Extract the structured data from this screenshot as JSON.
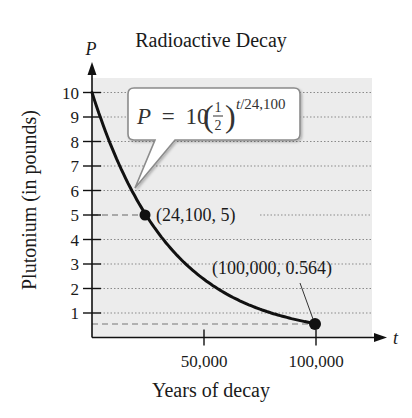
{
  "page": {
    "top_cut_text": "...after 100,000 years."
  },
  "chart_data": {
    "type": "line",
    "title": "Radioactive Decay",
    "xlabel": "Years of decay",
    "ylabel": "Plutonium (in pounds)",
    "x_axis_var": "t",
    "y_axis_var": "P",
    "xlim": [
      0,
      120000
    ],
    "ylim": [
      0,
      10.5
    ],
    "x_ticks": [
      50000,
      100000
    ],
    "x_tick_labels": [
      "50,000",
      "100,000"
    ],
    "y_ticks": [
      1,
      2,
      3,
      4,
      5,
      6,
      7,
      8,
      9,
      10
    ],
    "y_tick_labels": [
      "1",
      "2",
      "3",
      "4",
      "5",
      "6",
      "7",
      "8",
      "9",
      "10"
    ],
    "grid": "horizontal dotted",
    "equation": "P = 10(1/2)^(t/24,100)",
    "equation_parts": {
      "lhs": "P",
      "eq": "=",
      "coef": "10",
      "num": "1",
      "den": "2",
      "exp": "t/24,100"
    },
    "series": [
      {
        "name": "P = 10(1/2)^(t/24,100)",
        "x": [
          0,
          10000,
          20000,
          24100,
          30000,
          40000,
          50000,
          60000,
          70000,
          80000,
          90000,
          100000
        ],
        "values": [
          10,
          7.5,
          5.63,
          5,
          4.22,
          3.16,
          2.38,
          1.78,
          1.34,
          1.0,
          0.75,
          0.564
        ]
      }
    ],
    "highlighted_points": [
      {
        "x": 24100,
        "y": 5,
        "label": "(24,100, 5)"
      },
      {
        "x": 100000,
        "y": 0.564,
        "label": "(100,000, 0.564)"
      }
    ],
    "colors": {
      "plot_bg": "#ececec",
      "curve": "#111111",
      "grid": "#8a8a8a",
      "dashed": "#777777",
      "callout_border": "#8c8c8c",
      "callout_fill": "#ffffff"
    }
  }
}
